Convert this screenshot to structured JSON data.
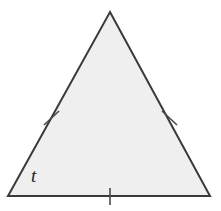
{
  "figure": {
    "kind": "geometry-diagram",
    "shape_name": "triangle",
    "background_color": "#ffffff",
    "fill_color": "#efefef",
    "stroke_color": "#3a3a3a",
    "stroke_width": 2,
    "tick_color": "#4a4a4a",
    "tick_width": 1.6,
    "label_color": "#1f1f1f",
    "vertices": [
      {
        "name": "apex",
        "x": 110,
        "y": 12
      },
      {
        "name": "bottom-right",
        "x": 210,
        "y": 196
      },
      {
        "name": "bottom-left",
        "x": 8,
        "y": 196
      }
    ],
    "sides": [
      {
        "name": "left-side",
        "from": "bottom-left",
        "to": "apex",
        "tick_count": 1,
        "tick": {
          "cx": 51,
          "cy": 118,
          "x1": 44,
          "y1": 125,
          "x2": 59,
          "y2": 111
        }
      },
      {
        "name": "right-side",
        "from": "apex",
        "to": "bottom-right",
        "tick_count": 1,
        "tick": {
          "cx": 169,
          "cy": 118,
          "x1": 162,
          "y1": 111,
          "x2": 177,
          "y2": 125
        }
      },
      {
        "name": "bottom-side",
        "from": "bottom-left",
        "to": "bottom-right",
        "tick_count": 1,
        "tick": {
          "cx": 110,
          "cy": 196,
          "x1": 110,
          "y1": 188,
          "x2": 110,
          "y2": 205
        }
      }
    ],
    "angle_labels": [
      {
        "name": "angle-t",
        "text": "t",
        "at_vertex": "bottom-left",
        "x": 31,
        "y": 166
      }
    ]
  }
}
